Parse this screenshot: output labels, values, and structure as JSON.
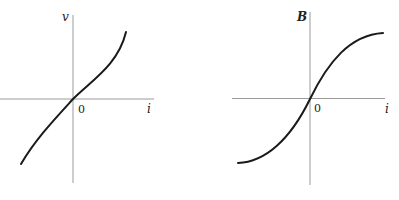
{
  "diagrams": [
    {
      "name": "voltage-current-characteristic",
      "y_axis_label": "v",
      "x_axis_label": "i",
      "origin_label": "0",
      "curve_shape": "monotonic odd curve, steepening at ends (v vs i)"
    },
    {
      "name": "magnetization-curve",
      "y_axis_label": "B",
      "x_axis_label": "i",
      "origin_label": "0",
      "curve_shape": "S-shaped saturating curve (B vs i)"
    }
  ]
}
